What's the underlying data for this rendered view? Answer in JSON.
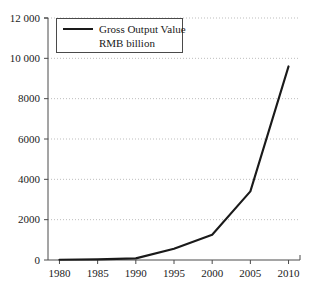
{
  "chart_data": {
    "type": "line",
    "title": "",
    "xlabel": "",
    "ylabel": "",
    "x": [
      1980,
      1985,
      1990,
      1995,
      2000,
      2005,
      2010
    ],
    "series": [
      {
        "name": "Gross Output Value RMB billion",
        "values": [
          10,
          30,
          80,
          560,
          1250,
          3400,
          9600
        ]
      }
    ],
    "categories": [
      "1980",
      "1985",
      "1990",
      "1995",
      "2000",
      "2005",
      "2010"
    ],
    "xlim": [
      1978.5,
      2011.5
    ],
    "ylim": [
      0,
      12000
    ],
    "xticks": [
      "1980",
      "1985",
      "1990",
      "1995",
      "2000",
      "2005",
      "2010"
    ],
    "yticks": [
      "0",
      "2000",
      "4000",
      "6000",
      "8000",
      "10 000",
      "12 000"
    ],
    "ytick_values": [
      0,
      2000,
      4000,
      6000,
      8000,
      10000,
      12000
    ],
    "grid": "horizontal-dotted",
    "legend_position": "top-left-inside",
    "line_color": "#1a1a1a",
    "grid_color": "#bdbdbd",
    "axis_color": "#4a4a4a"
  },
  "legend": {
    "line_label_1": "Gross Output Value",
    "line_label_2": "RMB billion"
  },
  "axes": {
    "y_labels": [
      "12 000",
      "10 000",
      "8000",
      "6000",
      "4000",
      "2000",
      "0"
    ],
    "x_labels": [
      "1980",
      "1985",
      "1990",
      "1995",
      "2000",
      "2005",
      "2010"
    ]
  }
}
